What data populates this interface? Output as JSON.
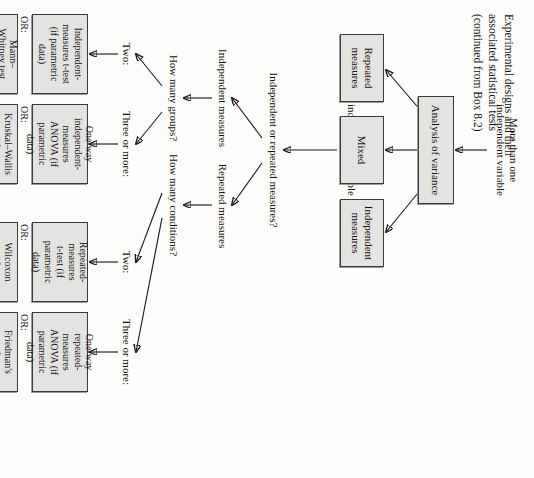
{
  "figure": {
    "title": "Experimental designs and their\nassociated statistical tests\n(continued from Box 8.2)",
    "orientation": "rotated-90-clockwise",
    "box_fill": "#e3e3e1",
    "box_border": "#3b3b3b",
    "ink": "#15120f"
  },
  "branches": {
    "more_than_one": "More than one\nindependent variable",
    "one_variable": "One\nindependent variable"
  },
  "nodes": {
    "anova": "Analysis of variance",
    "independent_measures": "Independent\nmeasures",
    "mixed": "Mixed",
    "repeated_measures": "Repeated\nmeasures"
  },
  "questions": {
    "design_type": "Independent or repeated measures?",
    "how_many_groups": "How many groups?",
    "how_many_conditions": "How many conditions?"
  },
  "path_labels": {
    "independent_measures": "Independent measures",
    "repeated_measures": "Repeated measures",
    "two_groups": "Two:",
    "three_or_more_groups": "Three or more:",
    "two_conditions": "Two:",
    "three_or_more_conditions": "Three or more:"
  },
  "or_label": "OR:",
  "tests": {
    "independent_two_parametric": "Independent-\nmeasures t-test\n(if parametric\ndata)",
    "independent_two_nonparametric": "Mann–\nWhitney test\n(if non-\nparametric\ndata)",
    "independent_many_parametric": "One-way\nindependent-\nmeasures\nANOVA (if\nparametric\ndata)",
    "independent_many_nonparametric": "Kruskal–Wallis\ntest (if non-\nparametric\ndata)",
    "repeated_two_parametric": "Repeated-\nmeasures\nt-test (if\nparametric\ndata)",
    "repeated_two_nonparametric": "Wilcoxon\ntest (if non-\nparametric\ndata)",
    "repeated_many_parametric": "One-way\nrepeated-\nmeasures\nANOVA (if\nparametric\ndata)",
    "repeated_many_nonparametric": "Friedman's\ntest (if non-\nparametric\ndata)"
  }
}
